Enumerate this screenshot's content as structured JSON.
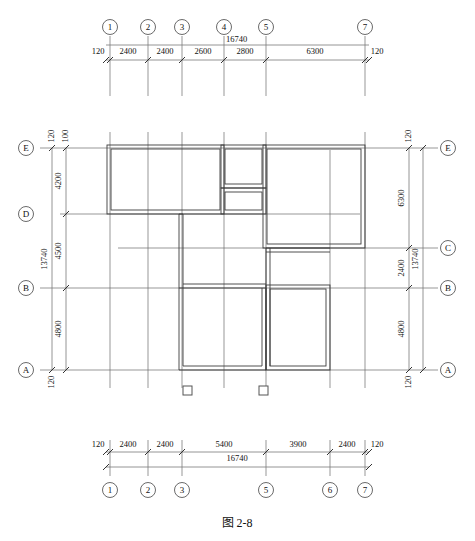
{
  "figure": {
    "caption": "图  2-8",
    "overall_width": "16740",
    "overall_height": "13740",
    "wall_thickness": "120"
  },
  "top_dimension_chain": {
    "total": "16740",
    "segments": [
      "120",
      "2400",
      "2400",
      "2600",
      "2800",
      "6300",
      "120"
    ],
    "bubbles": [
      "1",
      "2",
      "3",
      "4",
      "5",
      "7"
    ]
  },
  "bottom_dimension_chain": {
    "total": "16740",
    "segments": [
      "120",
      "2400",
      "2400",
      "5400",
      "3900",
      "2400",
      "120"
    ],
    "bubbles": [
      "1",
      "2",
      "3",
      "5",
      "6",
      "7"
    ]
  },
  "left_dimension_chain": {
    "total": "13740",
    "top_offsets": [
      "120",
      "100"
    ],
    "bottom_offset": "120",
    "segments": [
      "4200",
      "4500",
      "4800"
    ],
    "bubbles": [
      "E",
      "D",
      "B",
      "A"
    ]
  },
  "right_dimension_chain": {
    "total": "13740",
    "top_offset": "120",
    "bottom_offset": "120",
    "segments": [
      "6300",
      "2400",
      "4800"
    ],
    "bubbles": [
      "E",
      "C",
      "B",
      "A"
    ]
  },
  "grid": {
    "vertical_labels": [
      "1",
      "2",
      "3",
      "4",
      "5",
      "6",
      "7"
    ],
    "horizontal_labels": [
      "A",
      "B",
      "C",
      "D",
      "E"
    ]
  },
  "symbols": {
    "section_marker_count": 2,
    "section_marker_name": "column-symbol"
  },
  "colors": {
    "wall": "#3d3d3d",
    "gridline": "#6b6b6b",
    "dimline": "#7a7a7a",
    "text": "#111111",
    "background": "#ffffff"
  }
}
